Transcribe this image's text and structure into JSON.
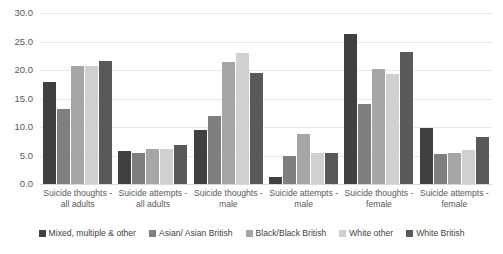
{
  "chart_data": {
    "type": "bar",
    "title": "",
    "xlabel": "",
    "ylabel": "",
    "ylim": [
      0,
      30
    ],
    "ytick_labels": [
      "30.0",
      "25.0",
      "20.0",
      "15.0",
      "10.0",
      "5.0",
      "0.0"
    ],
    "ytick_values": [
      30,
      25,
      20,
      15,
      10,
      5,
      0
    ],
    "grid": true,
    "legend_position": "bottom",
    "categories": [
      "Suicide thoughts - all adults",
      "Suicide attempts - all adults",
      "Suicide thoughts - male",
      "Suicide attempts - male",
      "Suicide thoughts - female",
      "Suicide attempts - female"
    ],
    "series": [
      {
        "name": "Mixed, multiple & other",
        "color": "#404040",
        "values": [
          17.9,
          5.8,
          9.4,
          1.3,
          26.4,
          9.8
        ]
      },
      {
        "name": "Asian/ Asian British",
        "color": "#7f7f7f",
        "values": [
          13.1,
          5.5,
          12.0,
          5.0,
          14.1,
          5.3
        ]
      },
      {
        "name": "Black/Black British",
        "color": "#a6a6a6",
        "values": [
          20.7,
          6.2,
          21.4,
          8.8,
          20.2,
          5.4
        ]
      },
      {
        "name": "White other",
        "color": "#d0d0d0",
        "values": [
          20.7,
          6.1,
          23.0,
          5.5,
          19.3,
          6.0
        ]
      },
      {
        "name": "White British",
        "color": "#595959",
        "values": [
          21.6,
          6.9,
          19.5,
          5.4,
          23.2,
          8.3
        ]
      }
    ]
  }
}
